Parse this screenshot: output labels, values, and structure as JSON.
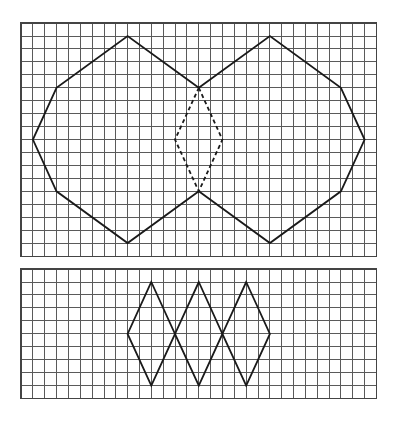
{
  "colors": {
    "background": "#ffffff",
    "grid_line": "#5a5a5a",
    "shape_stroke": "#1a1a1a"
  },
  "panels": [
    {
      "name": "top-grid-panel",
      "origin": [
        21,
        23
      ],
      "cell_w": 11.85,
      "cell_h": 12.95,
      "cols": 30,
      "rows": 18,
      "shapes": [
        {
          "name": "left-octagon",
          "style": "solid",
          "closed": false,
          "points": [
            [
              15,
              5
            ],
            [
              9,
              1
            ],
            [
              3,
              5
            ],
            [
              1,
              9
            ],
            [
              3,
              13
            ],
            [
              9,
              17
            ],
            [
              15,
              13
            ]
          ]
        },
        {
          "name": "right-octagon",
          "style": "solid",
          "closed": false,
          "points": [
            [
              15,
              5
            ],
            [
              21,
              1
            ],
            [
              27,
              5
            ],
            [
              29,
              9
            ],
            [
              27,
              13
            ],
            [
              21,
              17
            ],
            [
              15,
              13
            ]
          ]
        },
        {
          "name": "dashed-center-rhombus",
          "style": "dashed",
          "closed": true,
          "points": [
            [
              15,
              5
            ],
            [
              17,
              9
            ],
            [
              15,
              13
            ],
            [
              13,
              9
            ]
          ]
        }
      ]
    },
    {
      "name": "bottom-grid-panel",
      "origin": [
        21,
        269
      ],
      "cell_w": 11.85,
      "cell_h": 12.97,
      "cols": 30,
      "rows": 10,
      "shapes": [
        {
          "name": "rhombus-1",
          "style": "solid",
          "closed": true,
          "points": [
            [
              11,
              1
            ],
            [
              13,
              5
            ],
            [
              11,
              9
            ],
            [
              9,
              5
            ]
          ]
        },
        {
          "name": "rhombus-2",
          "style": "solid",
          "closed": true,
          "points": [
            [
              15,
              1
            ],
            [
              17,
              5
            ],
            [
              15,
              9
            ],
            [
              13,
              5
            ]
          ]
        },
        {
          "name": "rhombus-3",
          "style": "solid",
          "closed": true,
          "points": [
            [
              19,
              1
            ],
            [
              21,
              5
            ],
            [
              19,
              9
            ],
            [
              17,
              5
            ]
          ]
        }
      ]
    }
  ]
}
